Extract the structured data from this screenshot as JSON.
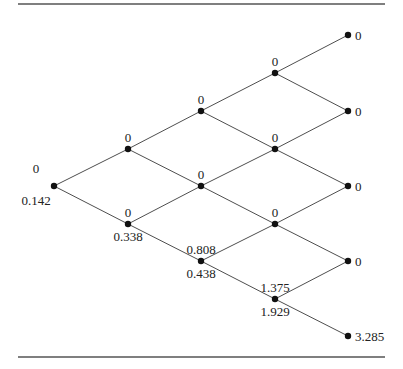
{
  "diagram": {
    "type": "binomial-tree",
    "steps": 4,
    "colors": {
      "edge": "#3a3a3a",
      "node": "#111111",
      "text": "#222222",
      "rule": "#555555"
    },
    "nodes": [
      {
        "id": "n0_0",
        "x": 54,
        "y": 186,
        "above": "0",
        "below": "0.142",
        "right": null
      },
      {
        "id": "n1_0",
        "x": 128,
        "y": 149,
        "above": "0",
        "below": null,
        "right": null
      },
      {
        "id": "n1_1",
        "x": 128,
        "y": 224,
        "above": "0",
        "below": "0.338",
        "right": null
      },
      {
        "id": "n2_0",
        "x": 201,
        "y": 111,
        "above": "0",
        "below": null,
        "right": null
      },
      {
        "id": "n2_1",
        "x": 201,
        "y": 186,
        "above": "0",
        "below": null,
        "right": null
      },
      {
        "id": "n2_2",
        "x": 201,
        "y": 261,
        "above": "0.808",
        "below": "0.438",
        "right": null
      },
      {
        "id": "n3_0",
        "x": 275,
        "y": 73,
        "above": "0",
        "below": null,
        "right": null
      },
      {
        "id": "n3_1",
        "x": 275,
        "y": 149,
        "above": "0",
        "below": null,
        "right": null
      },
      {
        "id": "n3_2",
        "x": 275,
        "y": 224,
        "above": "0",
        "below": null,
        "right": null
      },
      {
        "id": "n3_3",
        "x": 275,
        "y": 299,
        "above": "1.375",
        "below": "1.929",
        "right": null
      },
      {
        "id": "n4_0",
        "x": 348,
        "y": 35,
        "above": null,
        "below": null,
        "right": "0"
      },
      {
        "id": "n4_1",
        "x": 348,
        "y": 111,
        "above": null,
        "below": null,
        "right": "0"
      },
      {
        "id": "n4_2",
        "x": 348,
        "y": 186,
        "above": null,
        "below": null,
        "right": "0"
      },
      {
        "id": "n4_3",
        "x": 348,
        "y": 261,
        "above": null,
        "below": null,
        "right": "0"
      },
      {
        "id": "n4_4",
        "x": 348,
        "y": 336,
        "above": null,
        "below": null,
        "right": "3.285"
      }
    ],
    "edges": [
      [
        "n0_0",
        "n1_0"
      ],
      [
        "n0_0",
        "n1_1"
      ],
      [
        "n1_0",
        "n2_0"
      ],
      [
        "n1_0",
        "n2_1"
      ],
      [
        "n1_1",
        "n2_1"
      ],
      [
        "n1_1",
        "n2_2"
      ],
      [
        "n2_0",
        "n3_0"
      ],
      [
        "n2_0",
        "n3_1"
      ],
      [
        "n2_1",
        "n3_1"
      ],
      [
        "n2_1",
        "n3_2"
      ],
      [
        "n2_2",
        "n3_2"
      ],
      [
        "n2_2",
        "n3_3"
      ],
      [
        "n3_0",
        "n4_0"
      ],
      [
        "n3_0",
        "n4_1"
      ],
      [
        "n3_1",
        "n4_1"
      ],
      [
        "n3_1",
        "n4_2"
      ],
      [
        "n3_2",
        "n4_2"
      ],
      [
        "n3_2",
        "n4_3"
      ],
      [
        "n3_3",
        "n4_3"
      ],
      [
        "n3_3",
        "n4_4"
      ]
    ],
    "rules": {
      "top": {
        "x1": 18,
        "x2": 385,
        "y": 4
      },
      "bottom": {
        "x1": 18,
        "x2": 385,
        "y": 357
      }
    }
  }
}
